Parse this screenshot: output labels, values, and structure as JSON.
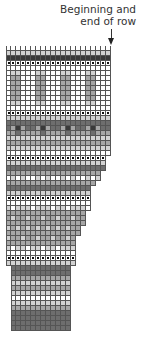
{
  "annotation": {
    "line1": "Beginning and",
    "line2": "end of row"
  },
  "chart": {
    "cell_size": 5,
    "legend_key": {
      "w": "white",
      "l": "light gray",
      "m": "medium gray",
      "d": "dark gray",
      "k": "charcoal",
      "p": "purl bump"
    },
    "rows": [
      {
        "o": 0,
        "s": "wwwwwwwwwwwwwwwwwwwww"
      },
      {
        "o": 0,
        "s": "lllllllllllllllllllll"
      },
      {
        "o": 0,
        "s": "kkkkkkkkkkkkkkkkkkkkk"
      },
      {
        "o": 0,
        "s": "ppppppppppppppppppppp"
      },
      {
        "o": 0,
        "s": "wwwwwwwwwwwwwwwwwwwww"
      },
      {
        "o": 0,
        "s": "wllwwwllwwwllwwwllwww"
      },
      {
        "o": 0,
        "s": "wmmwwwmmwwwmmwwwmmwww"
      },
      {
        "o": 0,
        "s": "wmmwwwmmwwwmmwwwmmwww"
      },
      {
        "o": 0,
        "s": "wmmwwwmmwwwmmwwwmmwww"
      },
      {
        "o": 0,
        "s": "wmmwwwmmwwwmmwwwmmwww"
      },
      {
        "o": 0,
        "s": "wmmwwwmmwwwmmwwwmmwww"
      },
      {
        "o": 0,
        "s": "wllwwwllwwwllwwwllwww"
      },
      {
        "o": 0,
        "s": "wwwwwwwwwwwwwwwwwwwww"
      },
      {
        "o": 0,
        "s": "ppppppppppppppppppppp"
      },
      {
        "o": 0,
        "s": "lllllllllllllllllllll"
      },
      {
        "o": 0,
        "s": "ddddddddddddddddddddd"
      },
      {
        "o": 0,
        "s": "dmkmddmkmddmkmddmkmdd"
      },
      {
        "o": 0,
        "s": "mmdmmmmdmmmmdmmmmdmmm"
      },
      {
        "o": 0,
        "s": "lllllllllllllllllllll"
      },
      {
        "o": 0,
        "s": "mmmmmmmmmmmmmmmmmmmmm"
      },
      {
        "o": 0,
        "s": "lllllllllllllllllllll"
      },
      {
        "o": 0,
        "s": "wwwwwwwwwwwwwwwwwwwww"
      },
      {
        "o": 0,
        "s": "pppppppppppppppppppp"
      },
      {
        "o": 0,
        "s": "llllllllllllllllllll"
      },
      {
        "o": 0,
        "s": "dddddddddddddddddddd"
      },
      {
        "o": 0,
        "s": "mmmmmmmmmmmmmmmmmmm"
      },
      {
        "o": 0,
        "s": "wlwlwwlwlwwlwlwwlwl"
      },
      {
        "o": 0,
        "s": "mmmmmmmmmmmmmmmmmm"
      },
      {
        "o": 0,
        "s": "ddddddddddddddddd"
      },
      {
        "o": 0,
        "s": "lllllllllllllllll"
      },
      {
        "o": 0,
        "s": "ppppppppppppppppp"
      },
      {
        "o": 0,
        "s": "wwwwwwwwwwwwwwwww"
      },
      {
        "o": 0,
        "s": "lwlllwlllwllwlllw"
      },
      {
        "o": 0,
        "s": "mmmmmmmmmmmmmmmm"
      },
      {
        "o": 0,
        "s": "mlmmlmmlmmlmmlmm"
      },
      {
        "o": 0,
        "s": "mmmmmmmmmmmmmmmm"
      },
      {
        "o": 0,
        "s": "lmlmlmlmlmlmlmm"
      },
      {
        "o": 0,
        "s": "mmmmmmmmmmmmmmm"
      },
      {
        "o": 0,
        "s": "lmmlmmlmmlmmlm"
      },
      {
        "o": 0,
        "s": "mmmmmmmmmmmmmm"
      },
      {
        "o": 0,
        "s": "lwllwllwllwlll"
      },
      {
        "o": 0,
        "s": "wwwwwwwwwwwwww"
      },
      {
        "o": 0,
        "s": "pppppppppppppp"
      },
      {
        "o": 0,
        "s": "llllllllllllll"
      },
      {
        "o": 1,
        "s": "dddddddddddd"
      },
      {
        "o": 1,
        "s": "dddddddddddd"
      },
      {
        "o": 1,
        "s": "mmmmmmmmmmmm"
      },
      {
        "o": 1,
        "s": "llllllllllll"
      },
      {
        "o": 1,
        "s": "mmmmmmmmmmmm"
      },
      {
        "o": 1,
        "s": "llllllllllll"
      },
      {
        "o": 1,
        "s": "wwwwwwwwwwww"
      },
      {
        "o": 1,
        "s": "llllllllllll"
      },
      {
        "o": 1,
        "s": "mmmmmmmmmmmm"
      },
      {
        "o": 1,
        "s": "dddddddddddd"
      },
      {
        "o": 1,
        "s": "dddddddddddd"
      },
      {
        "o": 1,
        "s": "dddddddddddd"
      },
      {
        "o": 1,
        "s": "dddddddddddd"
      }
    ]
  }
}
